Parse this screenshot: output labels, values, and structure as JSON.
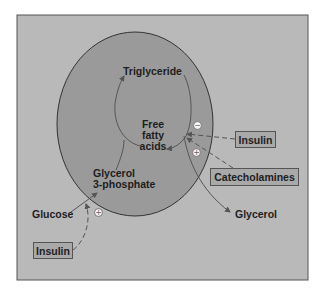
{
  "diagram": {
    "colors": {
      "panel_background": "#b9b9b9",
      "panel_border": "#555555",
      "cell_fill": "#9a9a9a",
      "cell_outline": "#333333",
      "arrow": "#555555",
      "box_fill": "#a9a9a9",
      "text": "#1e1e1e"
    },
    "nodes": {
      "triglyceride": "Triglyceride",
      "ffa_line1": "Free",
      "ffa_line2": "fatty",
      "ffa_line3": "acids",
      "g3p_line1": "Glycerol",
      "g3p_line2": "3-phosphate",
      "glucose": "Glucose",
      "glycerol": "Glycerol"
    },
    "regulators": {
      "insulin_right": "Insulin",
      "catecholamines": "Catecholamines",
      "insulin_bottom": "Insulin"
    },
    "signs": {
      "insulin_right_effect": "−",
      "catecholamines_effect": "+",
      "insulin_bottom_effect": "+"
    }
  }
}
